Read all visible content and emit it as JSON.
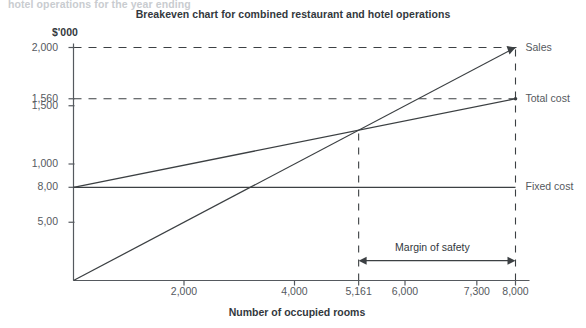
{
  "page": {
    "clipped_header_text": "hotel operations for the year ending",
    "title": "Breakeven chart for combined restaurant and hotel operations"
  },
  "chart_data": {
    "type": "line",
    "title": "Breakeven chart for combined restaurant and hotel operations",
    "xlabel": "Number of occupied rooms",
    "ylabel": "$'000",
    "xlim": [
      0,
      8000
    ],
    "ylim": [
      0,
      2000
    ],
    "grid": false,
    "legend_position": "right-inline",
    "x_ticks": [
      {
        "value": 2000,
        "label": "2,000"
      },
      {
        "value": 4000,
        "label": "4,000"
      },
      {
        "value": 5161,
        "label": "5,161"
      },
      {
        "value": 6000,
        "label": "6,000"
      },
      {
        "value": 7300,
        "label": "7,300"
      },
      {
        "value": 8000,
        "label": "8,000"
      }
    ],
    "y_ticks": [
      {
        "value": 2000,
        "label": "2,000"
      },
      {
        "value": 1560,
        "label": "1,560"
      },
      {
        "value": 1500,
        "label": "1,500"
      },
      {
        "value": 1000,
        "label": "1,000"
      },
      {
        "value": 800,
        "label": "8,00"
      },
      {
        "value": 500,
        "label": "5,00"
      }
    ],
    "series": [
      {
        "name": "Sales",
        "label": "Sales",
        "points": [
          [
            0,
            0
          ],
          [
            8000,
            2000
          ]
        ]
      },
      {
        "name": "Total cost",
        "label": "Total cost",
        "points": [
          [
            0,
            800
          ],
          [
            8000,
            1560
          ]
        ]
      },
      {
        "name": "Fixed cost",
        "label": "Fixed cost",
        "points": [
          [
            0,
            800
          ],
          [
            8000,
            800
          ]
        ]
      }
    ],
    "reference_lines": [
      {
        "name": "sales-2000-dashed",
        "orientation": "horizontal",
        "value": 2000
      },
      {
        "name": "total-cost-1560-dashed",
        "orientation": "horizontal",
        "value": 1560
      },
      {
        "name": "breakeven-dashed",
        "orientation": "vertical",
        "value": 5161
      },
      {
        "name": "capacity-dashed",
        "orientation": "vertical",
        "value": 8000
      }
    ],
    "annotations": [
      {
        "name": "margin-of-safety",
        "label": "Margin of safety",
        "from_x": 5161,
        "to_x": 8000,
        "at_y": 170
      }
    ],
    "breakeven_point": {
      "x": 5161,
      "y": 1290
    }
  },
  "colors": {
    "line": "#3c4043",
    "axis": "#55595e",
    "title_text": "#33383d",
    "tick_text": "#55595e",
    "background": "#ffffff",
    "clipped_text": "#c9ccd0"
  }
}
